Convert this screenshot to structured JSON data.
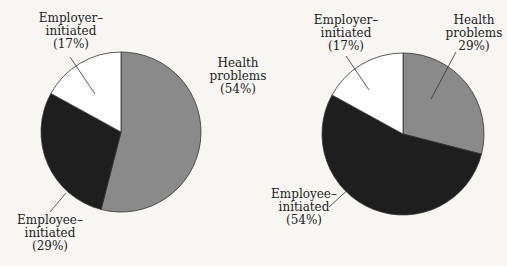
{
  "chart_data": [
    {
      "type": "pie",
      "title": "",
      "categories": [
        "Health problems",
        "Employee-initiated",
        "Employer-initiated"
      ],
      "values": [
        54,
        29,
        17
      ],
      "colors": [
        "#8a8a8a",
        "#1e1e1e",
        "#ffffff"
      ],
      "labels": [
        {
          "line1": "Health",
          "line2": "problems",
          "line3": "(54%)"
        },
        {
          "line1": "Employee–",
          "line2": "initiated",
          "line3": "(29%)"
        },
        {
          "line1": "Employer–",
          "line2": "initiated",
          "line3": "(17%)"
        }
      ]
    },
    {
      "type": "pie",
      "title": "",
      "categories": [
        "Health problems",
        "Employee-initiated",
        "Employer-initiated"
      ],
      "values": [
        29,
        54,
        17
      ],
      "colors": [
        "#8a8a8a",
        "#1e1e1e",
        "#ffffff"
      ],
      "labels": [
        {
          "line1": "Health",
          "line2": "problems",
          "line3": "29%)"
        },
        {
          "line1": "Employee–",
          "line2": "initiated",
          "line3": "(54%)"
        },
        {
          "line1": "Employer–",
          "line2": "initiated",
          "line3": "(17%)"
        }
      ]
    }
  ]
}
